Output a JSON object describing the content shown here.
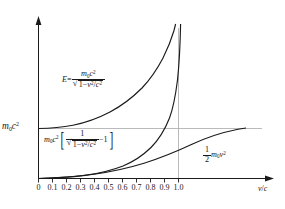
{
  "chart_data": {
    "type": "line",
    "title": "",
    "xlabel": "v/c",
    "ylabel": "m0c^2",
    "xlim": [
      0,
      1.12
    ],
    "ylim": [
      0,
      2.6
    ],
    "grid": false,
    "legend_position": "inline-annotations",
    "x_ticks": [
      "0",
      "0.1",
      "0.2",
      "0.3",
      "0.4",
      "0.5",
      "0.6",
      "0.7",
      "0.8",
      "0.9",
      "1.0"
    ],
    "x_tick_values": [
      0,
      0.1,
      0.2,
      0.3,
      0.4,
      0.5,
      0.6,
      0.7,
      0.8,
      0.9,
      1.0
    ],
    "y_ticks": [
      "m0c^2"
    ],
    "y_tick_values": [
      1.0
    ],
    "reference_lines": [
      {
        "name": "rest-energy-line",
        "orientation": "horizontal",
        "value": 1.0,
        "label": "m0c^2"
      },
      {
        "name": "light-speed-asymptote",
        "orientation": "vertical",
        "value": 1.0,
        "label": "1.0"
      }
    ],
    "series": [
      {
        "name": "total-energy",
        "label": "E = m0c^2 / sqrt(1 - v^2/c^2)",
        "color": "#1a1a1a",
        "x": [
          0,
          0.1,
          0.2,
          0.3,
          0.4,
          0.5,
          0.6,
          0.7,
          0.75,
          0.8,
          0.85,
          0.88,
          0.9,
          0.92,
          0.94,
          0.95,
          0.96,
          0.97,
          0.975,
          0.98
        ],
        "y": [
          1.0,
          1.005,
          1.021,
          1.048,
          1.091,
          1.155,
          1.25,
          1.4,
          1.512,
          1.667,
          1.898,
          2.105,
          2.294,
          2.552,
          2.931,
          3.203,
          3.571,
          4.113,
          4.501,
          5.025
        ]
      },
      {
        "name": "kinetic-energy-relativistic",
        "label": "m0c^2 [ 1/sqrt(1 - v^2/c^2) - 1 ]",
        "color": "#1a1a1a",
        "x": [
          0,
          0.1,
          0.2,
          0.3,
          0.4,
          0.5,
          0.6,
          0.7,
          0.75,
          0.8,
          0.85,
          0.88,
          0.9,
          0.92,
          0.94,
          0.95,
          0.96,
          0.97,
          0.975,
          0.98
        ],
        "y": [
          0,
          0.005,
          0.021,
          0.048,
          0.091,
          0.155,
          0.25,
          0.4,
          0.512,
          0.667,
          0.898,
          1.105,
          1.294,
          1.552,
          1.931,
          2.203,
          2.571,
          3.113,
          3.501,
          4.025
        ]
      },
      {
        "name": "kinetic-energy-classical",
        "label": "1/2 m0v^2",
        "color": "#1a1a1a",
        "x": [
          0,
          0.1,
          0.2,
          0.3,
          0.4,
          0.5,
          0.6,
          0.7,
          0.8,
          0.9,
          1.0,
          1.1,
          1.12
        ],
        "y": [
          0,
          0.005,
          0.02,
          0.045,
          0.08,
          0.125,
          0.18,
          0.245,
          0.32,
          0.405,
          0.5,
          0.605,
          0.627
        ]
      }
    ]
  },
  "axes": {
    "y_axis_label": {
      "m0": "m",
      "m0_sub": "0",
      "c": "c",
      "c_sup": "2"
    },
    "x_axis_label": {
      "v": "v",
      "slash": "/",
      "c": "c"
    }
  },
  "annotations": {
    "total_energy": {
      "lhs": "E",
      "equals": "=",
      "num_m": "m",
      "num_m_sub": "0",
      "num_c": "c",
      "num_c_sup": "2",
      "den_one": "1",
      "den_minus": "−",
      "den_v": "v",
      "den_v_sup": "2",
      "den_slash": "/",
      "den_c": "c",
      "den_c_sup": "2"
    },
    "kinetic_energy": {
      "m": "m",
      "m_sub": "0",
      "c": "c",
      "c_sup": "2",
      "bracket_open": "[",
      "num_one": "1",
      "den_one": "1",
      "den_minus": "−",
      "den_v": "v",
      "den_v_sup": "2",
      "den_slash": "/",
      "den_c": "c",
      "den_c_sup": "2",
      "minus_one": "−1",
      "bracket_close": "]"
    },
    "classical_energy": {
      "num": "1",
      "den": "2",
      "m": "m",
      "m_sub": "0",
      "v": "v",
      "v_sup": "2"
    }
  },
  "ticks": {
    "labels": [
      "0",
      "0.1",
      "0.2",
      "0.3",
      "0.4",
      "0.5",
      "0.6",
      "0.7",
      "0.8",
      "0.9",
      "1.0"
    ]
  },
  "colors": {
    "curve": "#1a1a1a",
    "axis": "#1a1a1a",
    "gridline": "#b9b9b9",
    "background": "#ffffff"
  }
}
